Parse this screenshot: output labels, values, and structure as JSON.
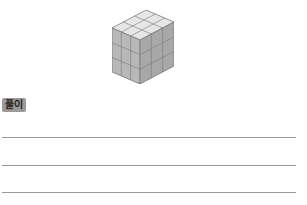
{
  "figure": {
    "grid_size": 3
  },
  "solution_label": "풀이",
  "answer_lines": 3
}
